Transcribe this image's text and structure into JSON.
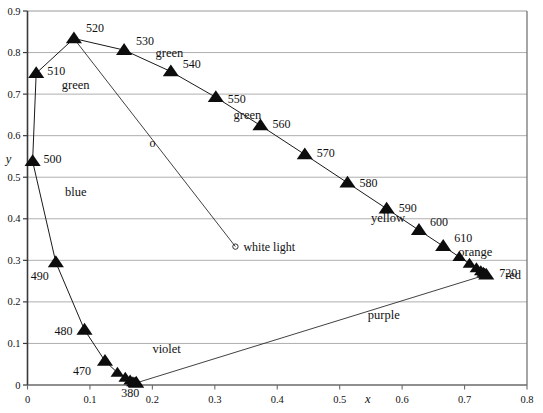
{
  "figure": {
    "name": "cie-chromaticity-diagram",
    "axes": {
      "x": {
        "label": "x",
        "min": 0,
        "max": 0.8,
        "ticks": [
          "0",
          "0.1",
          "0.2",
          "0.3",
          "0.4",
          "0.5",
          "0.6",
          "0.7",
          "0.8"
        ],
        "tick_values": [
          0,
          0.1,
          0.2,
          0.3,
          0.4,
          0.5,
          0.6,
          0.7,
          0.8
        ]
      },
      "y": {
        "label": "y",
        "min": 0,
        "max": 0.9,
        "ticks": [
          "0",
          "0.1",
          "0.2",
          "0.3",
          "0.4",
          "0.5",
          "0.6",
          "0.7",
          "0.8",
          "0.9"
        ],
        "tick_values": [
          0,
          0.1,
          0.2,
          0.3,
          0.4,
          0.5,
          0.6,
          0.7,
          0.8,
          0.9
        ]
      }
    },
    "white_point": {
      "label": "white light",
      "marker": "o",
      "x": 0.333,
      "y": 0.333
    },
    "line_marker": {
      "label": "o",
      "x": 0.2,
      "y": 0.572
    },
    "region_labels": [
      {
        "text": "green",
        "x": 0.055,
        "y": 0.712
      },
      {
        "text": "green",
        "x": 0.205,
        "y": 0.79
      },
      {
        "text": "green",
        "x": 0.33,
        "y": 0.64
      },
      {
        "text": "blue",
        "x": 0.06,
        "y": 0.455
      },
      {
        "text": "yellow",
        "x": 0.55,
        "y": 0.392
      },
      {
        "text": "orange",
        "x": 0.69,
        "y": 0.31
      },
      {
        "text": "violet",
        "x": 0.2,
        "y": 0.077
      },
      {
        "text": "purple",
        "x": 0.545,
        "y": 0.16
      },
      {
        "text": "red",
        "x": 0.765,
        "y": 0.255
      }
    ]
  },
  "chart_data": {
    "type": "line",
    "xlabel": "x",
    "ylabel": "y",
    "xlim": [
      0,
      0.8
    ],
    "ylim": [
      0,
      0.9
    ],
    "grid": "horizontal",
    "legend": "none",
    "marker_style": "filled-triangle",
    "series": [
      {
        "name": "spectral locus",
        "points": [
          {
            "label": "380",
            "wavelength_nm": 380,
            "x": 0.1741,
            "y": 0.005
          },
          {
            "label": "",
            "wavelength_nm": 390,
            "x": 0.1738,
            "y": 0.0049
          },
          {
            "label": "",
            "wavelength_nm": 400,
            "x": 0.1733,
            "y": 0.0048
          },
          {
            "label": "",
            "wavelength_nm": 410,
            "x": 0.1726,
            "y": 0.0048
          },
          {
            "label": "",
            "wavelength_nm": 420,
            "x": 0.1714,
            "y": 0.0051
          },
          {
            "label": "",
            "wavelength_nm": 430,
            "x": 0.1689,
            "y": 0.0069
          },
          {
            "label": "",
            "wavelength_nm": 440,
            "x": 0.1644,
            "y": 0.0109
          },
          {
            "label": "",
            "wavelength_nm": 450,
            "x": 0.1566,
            "y": 0.0177
          },
          {
            "label": "",
            "wavelength_nm": 460,
            "x": 0.144,
            "y": 0.0297
          },
          {
            "label": "470",
            "wavelength_nm": 470,
            "x": 0.1241,
            "y": 0.0578
          },
          {
            "label": "480",
            "wavelength_nm": 480,
            "x": 0.0913,
            "y": 0.1327
          },
          {
            "label": "490",
            "wavelength_nm": 490,
            "x": 0.0454,
            "y": 0.295
          },
          {
            "label": "500",
            "wavelength_nm": 500,
            "x": 0.0082,
            "y": 0.5384
          },
          {
            "label": "510",
            "wavelength_nm": 510,
            "x": 0.0139,
            "y": 0.7502
          },
          {
            "label": "520",
            "wavelength_nm": 520,
            "x": 0.0743,
            "y": 0.8338
          },
          {
            "label": "530",
            "wavelength_nm": 530,
            "x": 0.1547,
            "y": 0.8059
          },
          {
            "label": "540",
            "wavelength_nm": 540,
            "x": 0.2296,
            "y": 0.7543
          },
          {
            "label": "550",
            "wavelength_nm": 550,
            "x": 0.3016,
            "y": 0.6923
          },
          {
            "label": "560",
            "wavelength_nm": 560,
            "x": 0.3731,
            "y": 0.6245
          },
          {
            "label": "570",
            "wavelength_nm": 570,
            "x": 0.4441,
            "y": 0.5547
          },
          {
            "label": "580",
            "wavelength_nm": 580,
            "x": 0.5125,
            "y": 0.4866
          },
          {
            "label": "590",
            "wavelength_nm": 590,
            "x": 0.5752,
            "y": 0.4242
          },
          {
            "label": "600",
            "wavelength_nm": 600,
            "x": 0.627,
            "y": 0.3725
          },
          {
            "label": "610",
            "wavelength_nm": 610,
            "x": 0.6658,
            "y": 0.334
          },
          {
            "label": "",
            "wavelength_nm": 620,
            "x": 0.6915,
            "y": 0.3083
          },
          {
            "label": "",
            "wavelength_nm": 630,
            "x": 0.7079,
            "y": 0.292
          },
          {
            "label": "",
            "wavelength_nm": 640,
            "x": 0.719,
            "y": 0.2809
          },
          {
            "label": "",
            "wavelength_nm": 650,
            "x": 0.726,
            "y": 0.274
          },
          {
            "label": "",
            "wavelength_nm": 660,
            "x": 0.73,
            "y": 0.27
          },
          {
            "label": "",
            "wavelength_nm": 670,
            "x": 0.732,
            "y": 0.268
          },
          {
            "label": "720",
            "wavelength_nm": 720,
            "x": 0.7347,
            "y": 0.2653
          }
        ]
      }
    ],
    "straight_lines": [
      {
        "name": "purple-line",
        "from": [
          0.1741,
          0.005
        ],
        "to": [
          0.7347,
          0.2653
        ]
      },
      {
        "name": "green-to-white-line",
        "from": [
          0.0743,
          0.8338
        ],
        "to": [
          0.333,
          0.333
        ]
      }
    ]
  }
}
